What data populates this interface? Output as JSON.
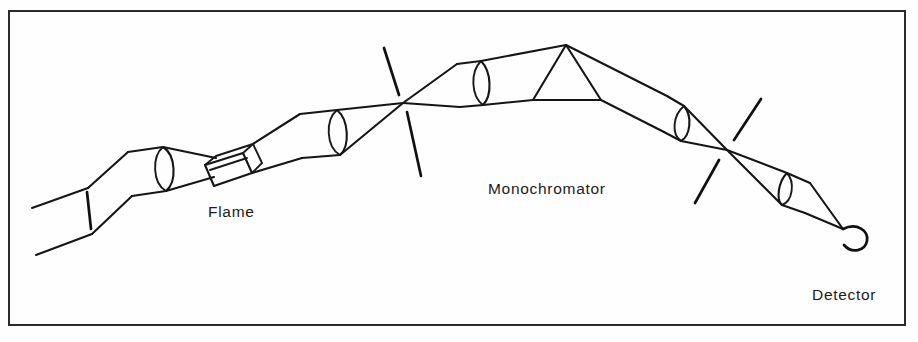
{
  "figure": {
    "kind": "optical-path-schematic",
    "instrument": "flame emission spectrophotometer optical path",
    "frame": {
      "border_color": "#2a2a2a",
      "background": "#fefefe"
    },
    "ink_color": "#151515"
  },
  "labels": {
    "flame": "Flame",
    "monochromator": "Monochromator",
    "detector": "Detector"
  },
  "components": [
    {
      "name": "source-beam",
      "type": "beam",
      "label": ""
    },
    {
      "name": "source-aperture",
      "type": "aperture",
      "label": ""
    },
    {
      "name": "lens-1",
      "type": "lens",
      "label": ""
    },
    {
      "name": "flame-cell",
      "type": "flame",
      "label": "Flame"
    },
    {
      "name": "lens-2",
      "type": "lens",
      "label": ""
    },
    {
      "name": "entrance-slit",
      "type": "slit",
      "label": ""
    },
    {
      "name": "collimating-lens",
      "type": "lens",
      "label": ""
    },
    {
      "name": "prism",
      "type": "prism",
      "label": ""
    },
    {
      "name": "focusing-lens",
      "type": "lens",
      "label": ""
    },
    {
      "name": "exit-slit",
      "type": "slit",
      "label": ""
    },
    {
      "name": "detector-lens",
      "type": "lens",
      "label": ""
    },
    {
      "name": "detector-tip",
      "type": "detector",
      "label": "Detector"
    }
  ]
}
